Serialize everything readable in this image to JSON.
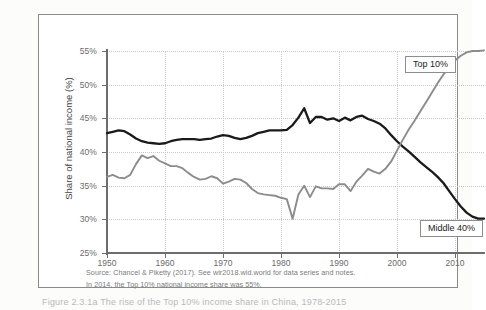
{
  "figure": {
    "y_axis_title": "Share of national income (%)",
    "source_line_1": "Source: Chancel & Piketty (2017). See wir2018.wid.world for data series and notes.",
    "source_line_2": "In 2014, the Top 10% national income share was 55%.",
    "caption": "Figure 2.3.1a  The rise of the Top 10% income share in China, 1978-2015",
    "label_top10": "Top 10%",
    "label_middle40": "Middle 40%",
    "colors": {
      "top10_line": "#8c8c8c",
      "middle40_line": "#1a1a1a",
      "axis": "#6d6d6d",
      "grid": "#c9c9c9",
      "box_border": "#8a8a8a",
      "tick_text": "#6b6b6b",
      "note_text": "#7b7b7b"
    }
  },
  "chart_data": {
    "type": "line",
    "title": "",
    "xlabel": "",
    "ylabel": "Share of national income (%)",
    "xlim": [
      1950,
      2015
    ],
    "ylim": [
      25,
      55
    ],
    "ytick_labels": [
      "25%",
      "30%",
      "35%",
      "40%",
      "45%",
      "50%",
      "55%"
    ],
    "ytick_values": [
      25,
      30,
      35,
      40,
      45,
      50,
      55
    ],
    "xtick_labels": [
      "1950",
      "1960",
      "1970",
      "1980",
      "1990",
      "2000",
      "2010"
    ],
    "xtick_values": [
      1950,
      1960,
      1970,
      1980,
      1990,
      2000,
      2010
    ],
    "grid": true,
    "legend": "inline-labels",
    "x": [
      1950,
      1951,
      1952,
      1953,
      1954,
      1955,
      1956,
      1957,
      1958,
      1959,
      1960,
      1961,
      1962,
      1963,
      1964,
      1965,
      1966,
      1967,
      1968,
      1969,
      1970,
      1971,
      1972,
      1973,
      1974,
      1975,
      1976,
      1977,
      1978,
      1979,
      1980,
      1981,
      1982,
      1983,
      1984,
      1985,
      1986,
      1987,
      1988,
      1989,
      1990,
      1991,
      1992,
      1993,
      1994,
      1995,
      1996,
      1997,
      1998,
      1999,
      2000,
      2001,
      2002,
      2003,
      2004,
      2005,
      2006,
      2007,
      2008,
      2009,
      2010,
      2011,
      2012,
      2013,
      2014,
      2015
    ],
    "series": [
      {
        "name": "Middle 40%",
        "color": "#1a1a1a",
        "values": [
          42.8,
          43.0,
          43.2,
          43.1,
          42.6,
          42.0,
          41.6,
          41.4,
          41.3,
          41.2,
          41.3,
          41.6,
          41.8,
          41.9,
          41.9,
          41.9,
          41.8,
          41.9,
          42.0,
          42.3,
          42.5,
          42.4,
          42.1,
          41.9,
          42.1,
          42.4,
          42.8,
          43.0,
          43.2,
          43.2,
          43.2,
          43.3,
          44.0,
          45.1,
          46.5,
          44.3,
          45.2,
          45.2,
          44.8,
          45.0,
          44.6,
          45.1,
          44.7,
          45.2,
          45.4,
          44.9,
          44.6,
          44.2,
          43.5,
          42.5,
          41.6,
          40.8,
          40.1,
          39.3,
          38.5,
          37.8,
          37.1,
          36.3,
          35.4,
          34.2,
          33.0,
          31.9,
          31.0,
          30.4,
          30.1,
          30.1
        ]
      },
      {
        "name": "Top 10%",
        "color": "#8c8c8c",
        "values": [
          36.3,
          36.6,
          36.2,
          36.1,
          36.6,
          38.2,
          39.5,
          39.1,
          39.4,
          38.7,
          38.3,
          37.9,
          37.9,
          37.6,
          36.9,
          36.3,
          35.9,
          36.0,
          36.4,
          36.1,
          35.3,
          35.6,
          36.0,
          35.9,
          35.4,
          34.5,
          33.9,
          33.7,
          33.6,
          33.5,
          33.2,
          33.0,
          30.1,
          33.7,
          35.0,
          33.3,
          34.9,
          34.6,
          34.6,
          34.5,
          35.2,
          35.2,
          34.2,
          35.6,
          36.5,
          37.5,
          37.1,
          36.8,
          37.5,
          38.6,
          40.2,
          41.8,
          43.3,
          44.6,
          46.0,
          47.4,
          48.8,
          50.2,
          51.5,
          52.6,
          53.6,
          54.3,
          54.8,
          55.0,
          55.0,
          55.1
        ]
      }
    ]
  }
}
